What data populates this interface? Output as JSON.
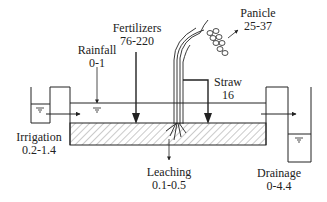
{
  "labels": {
    "fertilizers": {
      "name": "Fertilizers",
      "value": "76-220"
    },
    "rainfall": {
      "name": "Rainfall",
      "value": "0-1"
    },
    "panicle": {
      "name": "Panicle",
      "value": "25-37"
    },
    "straw": {
      "name": "Straw",
      "value": "16"
    },
    "irrigation": {
      "name": "Irrigation",
      "value": "0.2-1.4"
    },
    "leaching": {
      "name": "Leaching",
      "value": "0.1-0.5"
    },
    "drainage": {
      "name": "Drainage",
      "value": "0-4.4"
    }
  },
  "colors": {
    "stroke": "#222222",
    "background": "#ffffff",
    "hatch": "#555555"
  }
}
